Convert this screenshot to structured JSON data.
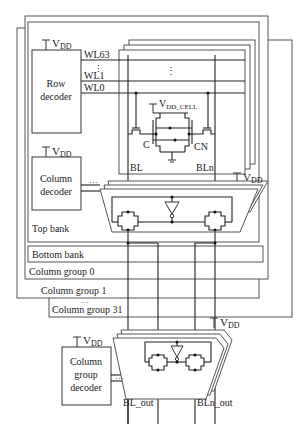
{
  "diagram": {
    "supply_label": "V",
    "supply_sub": "DD",
    "cell_supply_sub": "DD_CELL",
    "row_decoder": {
      "line1": "Row",
      "line2": "decoder"
    },
    "wordlines": [
      "WL63",
      "WL1",
      "WL0"
    ],
    "wordline_ellipsis": "⋮",
    "array_ellipsis": "⋮",
    "cell_nodes": {
      "c": "C",
      "cn": "CN"
    },
    "bitlines": {
      "bl": "BL",
      "bln": "BLn"
    },
    "column_decoder": {
      "line1": "Column",
      "line2": "decoder"
    },
    "bus_ellipsis": "…",
    "banks": {
      "top": "Top bank",
      "bottom": "Bottom bank"
    },
    "column_groups": [
      "Column group 0",
      "Column group 1",
      "Column group 31"
    ],
    "group_ellipsis": "…",
    "column_group_decoder": {
      "line1": "Column",
      "line2": "group",
      "line3": "decoder"
    },
    "outputs": {
      "bl_out": "BL_out",
      "bln_out": "BLn_out"
    }
  }
}
